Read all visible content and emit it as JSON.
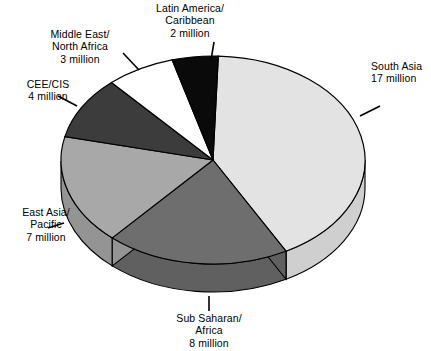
{
  "chart_data": {
    "type": "pie",
    "title": "",
    "unit": "million",
    "total": 41,
    "categories": [
      "South Asia",
      "Sub Saharan/Africa",
      "East Asia/Pacific",
      "CEE/CIS",
      "Middle East/North Africa",
      "Latin America/Caribbean"
    ],
    "values": [
      17,
      8,
      7,
      4,
      3,
      2
    ],
    "legend": "none",
    "grid": false,
    "slices": [
      {
        "name": "south-asia",
        "label_lines": [
          "South Asia",
          "17 million"
        ],
        "value": 17,
        "value_text": "17 million",
        "color": "#e3e3e3",
        "side_color": "#cfcfcf",
        "start_deg": -88,
        "sweep_deg": 149.3
      },
      {
        "name": "sub-saharan-africa",
        "label_lines": [
          "Sub Saharan/",
          "Africa",
          "8 million"
        ],
        "value": 8,
        "value_text": "8 million",
        "color": "#6e6e6e",
        "side_color": "#606060",
        "start_deg": 61.3,
        "sweep_deg": 70.2
      },
      {
        "name": "east-asia-pacific",
        "label_lines": [
          "East Asia/",
          "Pacific",
          "7 million"
        ],
        "value": 7,
        "value_text": "7 million",
        "color": "#a8a8a8",
        "side_color": "#949494",
        "start_deg": 131.5,
        "sweep_deg": 61.5
      },
      {
        "name": "cee-cis",
        "label_lines": [
          "CEE/CIS",
          "4 million"
        ],
        "value": 4,
        "value_text": "4 million",
        "color": "#3c3c3c",
        "side_color": "#343434",
        "start_deg": 193.0,
        "sweep_deg": 35.1
      },
      {
        "name": "middle-east-north-africa",
        "label_lines": [
          "Middle East/",
          "North Africa",
          "3 million"
        ],
        "value": 3,
        "value_text": "3 million",
        "color": "#ffffff",
        "side_color": "#efefef",
        "start_deg": 228.1,
        "sweep_deg": 26.3
      },
      {
        "name": "latin-america-caribbean",
        "label_lines": [
          "Latin America/",
          "Caribbean",
          "2 million"
        ],
        "value": 2,
        "value_text": "2 million",
        "color": "#0a0a0a",
        "side_color": "#000000",
        "start_deg": 254.4,
        "sweep_deg": 17.6
      }
    ]
  },
  "labels": {
    "latin_america": {
      "l1": "Latin America/",
      "l2": "Caribbean",
      "l3": "2 million"
    },
    "middle_east": {
      "l1": "Middle East/",
      "l2": "North Africa",
      "l3": "3 million"
    },
    "cee_cis": {
      "l1": "CEE/CIS",
      "l2": "4 million"
    },
    "east_asia": {
      "l1": "East Asia/",
      "l2": "Pacific",
      "l3": "7 million"
    },
    "sub_saharan": {
      "l1": "Sub Saharan/",
      "l2": "Africa",
      "l3": "8 million"
    },
    "south_asia": {
      "l1": "South Asia",
      "l2": "17 million"
    }
  },
  "style": {
    "outline": "#000000",
    "background": "#ffffff"
  }
}
